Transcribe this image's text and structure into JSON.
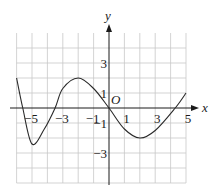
{
  "chart_data": {
    "type": "line",
    "title": "",
    "xlabel": "x",
    "ylabel": "y",
    "origin_label": "O",
    "xlim": [
      -6,
      5
    ],
    "ylim": [
      -5,
      5
    ],
    "grid": true,
    "x_tick_labels": [
      {
        "value": -5,
        "text": "−5"
      },
      {
        "value": -3,
        "text": "−3"
      },
      {
        "value": -1,
        "text": "−1"
      },
      {
        "value": 1,
        "text": "1"
      },
      {
        "value": 3,
        "text": "3"
      },
      {
        "value": 5,
        "text": "5"
      }
    ],
    "y_tick_labels": [
      {
        "value": 3,
        "text": "3"
      },
      {
        "value": 1,
        "text": "1"
      },
      {
        "value": -1,
        "text": "−1"
      },
      {
        "value": -3,
        "text": "−3"
      }
    ],
    "series": [
      {
        "name": "f(x)",
        "x": [
          -6,
          -5.6,
          -5,
          -4.2,
          -3.5,
          -3,
          -2,
          -1,
          0,
          1,
          2,
          3,
          4.3,
          5
        ],
        "y": [
          2,
          0,
          -2.4,
          -1.4,
          0,
          1.3,
          2,
          1.3,
          0,
          -1.4,
          -2,
          -1.5,
          0,
          1
        ]
      }
    ]
  }
}
